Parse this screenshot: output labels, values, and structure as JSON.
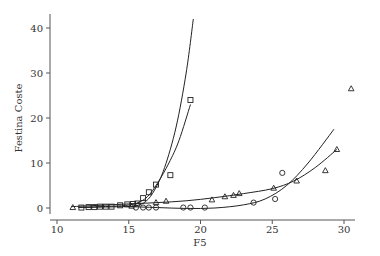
{
  "chart_data": {
    "type": "scatter",
    "title": "",
    "xlabel": "F5",
    "ylabel": "Festina Coste",
    "xlim": [
      10,
      31
    ],
    "ylim": [
      -1,
      44
    ],
    "xticks": [
      10,
      15,
      20,
      25,
      30
    ],
    "yticks": [
      0,
      10,
      20,
      30,
      40
    ],
    "grid": false,
    "legend": null,
    "series": [
      {
        "name": "squares",
        "marker": "square",
        "x": [
          11.7,
          12.2,
          12.6,
          13.0,
          13.4,
          13.8,
          14.4,
          14.9,
          15.3,
          15.6,
          16.0,
          16.4,
          16.9,
          17.9,
          19.3
        ],
        "y": [
          0.1,
          0.2,
          0.2,
          0.3,
          0.3,
          0.3,
          0.6,
          0.8,
          0.9,
          1.0,
          2.2,
          3.5,
          5.2,
          7.3,
          24.0
        ],
        "fits": [
          {
            "x": [
              11.5,
              13,
              14.5,
              15.5,
              16.2,
              16.8,
              17.5,
              18.3,
              19.0,
              19.5
            ],
            "y": [
              0.1,
              0.2,
              0.3,
              0.5,
              1.5,
              4.0,
              9.0,
              18.0,
              30.0,
              42.0
            ]
          },
          {
            "x": [
              11.5,
              13,
              14.5,
              15.5,
              16.3,
              17.0,
              17.8,
              18.5,
              19.3
            ],
            "y": [
              0.1,
              0.3,
              0.5,
              1.0,
              2.5,
              5.5,
              10.0,
              15.0,
              23.0
            ]
          }
        ]
      },
      {
        "name": "triangles",
        "marker": "triangle",
        "x": [
          11.1,
          15.2,
          16.9,
          17.6,
          20.8,
          21.7,
          22.3,
          22.7,
          25.1,
          26.7,
          28.7,
          29.5,
          30.5
        ],
        "y": [
          0.1,
          0.4,
          1.2,
          1.5,
          1.8,
          2.5,
          2.8,
          3.2,
          4.4,
          6.0,
          8.3,
          13.0,
          26.5
        ],
        "fit": {
          "x": [
            11,
            13,
            15,
            17,
            19,
            21,
            23,
            25,
            26.5,
            28,
            29.5
          ],
          "y": [
            0.3,
            0.6,
            0.9,
            1.2,
            1.6,
            2.3,
            3.2,
            4.3,
            6.0,
            9.0,
            13.0
          ]
        }
      },
      {
        "name": "circles",
        "marker": "circle",
        "x": [
          15.5,
          16.0,
          16.4,
          16.9,
          18.8,
          19.3,
          20.3,
          23.7,
          25.2,
          25.7
        ],
        "y": [
          0.1,
          0.1,
          0.1,
          0.1,
          0.1,
          0.1,
          0.1,
          1.2,
          2.0,
          7.8
        ],
        "fit": {
          "x": [
            15,
            17,
            19,
            21,
            23,
            24.5,
            26,
            27.5,
            29.3
          ],
          "y": [
            0.3,
            0.1,
            -0.1,
            0.0,
            0.7,
            2.0,
            5.0,
            10.0,
            17.5
          ]
        }
      }
    ]
  }
}
